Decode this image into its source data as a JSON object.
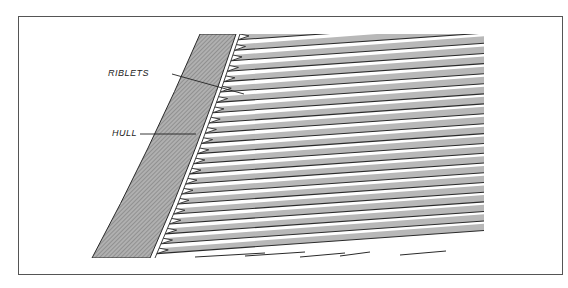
{
  "figure": {
    "labels": {
      "riblets": "RIBLETS",
      "hull": "HULL"
    },
    "colors": {
      "frame": "#555555",
      "hull_fill": "#9a9a9a",
      "riblet_fill": "#b8b8b8",
      "line": "#2a2a2a"
    },
    "riblet_count": 22
  }
}
